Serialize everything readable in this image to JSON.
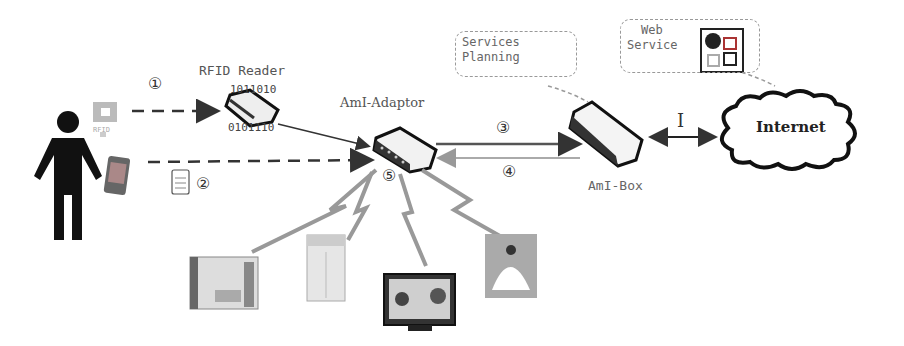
{
  "diagram": {
    "labels": {
      "rfid_reader": "RFID Reader",
      "rfid_bits_top": "1011010",
      "rfid_bits_bottom": "0101110",
      "aml_adaptor": "AmI-Adaptor",
      "aml_box": "AmI-Box",
      "internet": "Internet",
      "services_planning_line1": "Services",
      "services_planning_line2": "Planning",
      "web_service_line1": "Web",
      "web_service_line2": "Service",
      "rfid_tag": "RFID",
      "link_I": "I"
    },
    "steps": {
      "s1": "①",
      "s2": "②",
      "s3": "③",
      "s4": "④",
      "s5": "⑤"
    },
    "nodes": [
      "user",
      "rfid-tag",
      "mobile-phone",
      "rfid-reader",
      "aml-adaptor",
      "aml-box",
      "internet",
      "web-service",
      "curtain-device",
      "air-conditioner",
      "television",
      "lamp"
    ]
  }
}
